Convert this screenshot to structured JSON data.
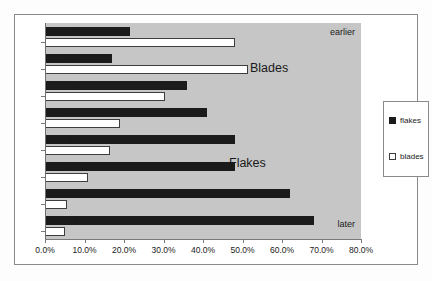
{
  "chart_data": {
    "type": "bar",
    "orientation": "horizontal",
    "title": "",
    "xlabel": "",
    "ylabel": "",
    "xlim": [
      0,
      80
    ],
    "xtick_labels": [
      "0.0%",
      "10.0%",
      "20.0%",
      "30.0%",
      "40.0%",
      "50.0%",
      "60.0%",
      "70.0%",
      "80.0%"
    ],
    "xtick_values": [
      0,
      10,
      20,
      30,
      40,
      50,
      60,
      70,
      80
    ],
    "grid": false,
    "categories": [
      "VII",
      "VI",
      "V",
      "IV",
      "III",
      "IIIa",
      "I",
      "I"
    ],
    "series": [
      {
        "name": "flakes",
        "color": "#1b1b1b",
        "values": [
          21.5,
          17.0,
          36.0,
          41.0,
          48.0,
          48.0,
          62.0,
          68.0
        ]
      },
      {
        "name": "blades",
        "color": "#ffffff",
        "values": [
          48.0,
          51.5,
          30.5,
          19.0,
          16.5,
          11.0,
          5.5,
          5.0
        ]
      }
    ],
    "legend": {
      "position": "right",
      "entries": [
        "flakes",
        "blades"
      ]
    },
    "annotations": [
      {
        "text": "earlier",
        "position": "top-right"
      },
      {
        "text": "later",
        "position": "bottom-right"
      },
      {
        "text": "Blades",
        "position": "upper-middle-right"
      },
      {
        "text": "Flakes",
        "position": "middle-right"
      }
    ]
  },
  "legend": {
    "entries": [
      {
        "label": "flakes"
      },
      {
        "label": "blades"
      }
    ]
  },
  "annotations": {
    "earlier": "earlier",
    "later": "later",
    "blades": "Blades",
    "flakes": "Flakes"
  }
}
